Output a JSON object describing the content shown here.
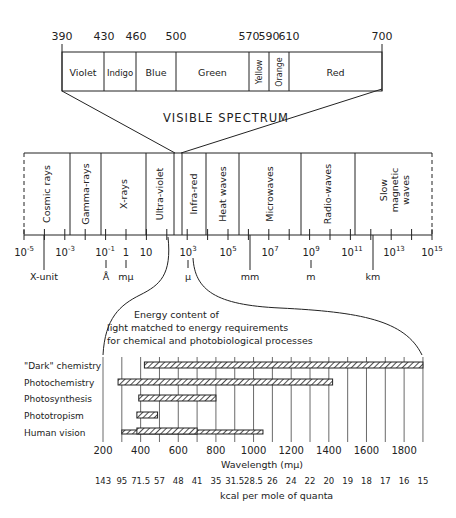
{
  "visible_spectrum": {
    "title": "VISIBLE SPECTRUM",
    "boundaries": [
      "390",
      "430",
      "460",
      "500",
      "570",
      "590",
      "610",
      "700"
    ],
    "bands": [
      {
        "label": "Violet",
        "from": 390,
        "to": 430,
        "vertical": false
      },
      {
        "label": "Indigo",
        "from": 430,
        "to": 460,
        "vertical": false
      },
      {
        "label": "Blue",
        "from": 460,
        "to": 500,
        "vertical": false
      },
      {
        "label": "Green",
        "from": 500,
        "to": 570,
        "vertical": false
      },
      {
        "label": "Yellow",
        "from": 570,
        "to": 590,
        "vertical": true
      },
      {
        "label": "Orange",
        "from": 590,
        "to": 610,
        "vertical": true
      },
      {
        "label": "Red",
        "from": 610,
        "to": 700,
        "vertical": false
      }
    ]
  },
  "em_spectrum": {
    "bands": [
      {
        "label": "Cosmic  rays"
      },
      {
        "label": "Gamma-rays"
      },
      {
        "label": "X-rays"
      },
      {
        "label": "Ultra-violet"
      },
      {
        "label": ""
      },
      {
        "label": "Infra-red"
      },
      {
        "label": "Heat  waves"
      },
      {
        "label": "Microwaves"
      },
      {
        "label": "Radio-waves"
      },
      {
        "label": "Slow magnetic waves",
        "lines": [
          "Slow",
          "magnetic",
          "waves"
        ]
      }
    ],
    "axis_ticks": [
      {
        "base": "10",
        "exp": "-5"
      },
      {
        "base": "10",
        "exp": "-3"
      },
      {
        "base": "10",
        "exp": "-1"
      },
      {
        "base": "1",
        "exp": ""
      },
      {
        "base": "10",
        "exp": ""
      },
      {
        "base": "10",
        "exp": "3"
      },
      {
        "base": "10",
        "exp": "5"
      },
      {
        "base": "10",
        "exp": "7"
      },
      {
        "base": "10",
        "exp": "9"
      },
      {
        "base": "10",
        "exp": "11"
      },
      {
        "base": "10",
        "exp": "13"
      },
      {
        "base": "10",
        "exp": "15"
      }
    ],
    "unit_labels": [
      "X-unit",
      "Å",
      "mμ",
      "μ",
      "mm",
      "m",
      "km"
    ]
  },
  "energy_chart": {
    "caption_lines": [
      "Energy content of",
      "light matched to energy requirements",
      "for chemical and photobiological processes"
    ],
    "xlabel": "Wavelength (mμ)",
    "secondary_label": "kcal per mole of quanta"
  },
  "chart_data": {
    "type": "bar",
    "xlabel": "Wavelength (mμ)",
    "x_ticks": [
      "200",
      "400",
      "600",
      "800",
      "1000",
      "1200",
      "1400",
      "1600",
      "1800"
    ],
    "xlim": [
      200,
      1900
    ],
    "secondary_axis_label": "kcal per mole of quanta",
    "secondary_ticks": [
      "143",
      "95",
      "71.5",
      "57",
      "48",
      "41",
      "35",
      "31.5",
      "28.5",
      "26",
      "24",
      "22",
      "20",
      "19",
      "18",
      "17",
      "16",
      "15"
    ],
    "categories": [
      "\"Dark\" chemistry",
      "Photochemistry",
      "Photosynthesis",
      "Phototropism",
      "Human vision"
    ],
    "series": [
      {
        "name": "range_start",
        "values": [
          420,
          280,
          390,
          380,
          300
        ]
      },
      {
        "name": "range_end",
        "values": [
          1900,
          1420,
          800,
          490,
          1050
        ]
      },
      {
        "name": "primary_start",
        "values": [
          420,
          280,
          390,
          380,
          380
        ]
      },
      {
        "name": "primary_end",
        "values": [
          1900,
          1420,
          800,
          490,
          700
        ]
      }
    ],
    "grid": true
  }
}
